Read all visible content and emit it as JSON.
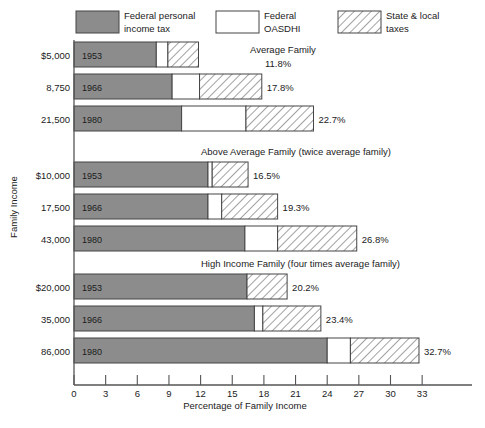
{
  "legend": {
    "items": [
      {
        "key": "gray",
        "label_line1": "Federal personal",
        "label_line2": "income tax",
        "color": "#8c8c8c",
        "pattern": "solid"
      },
      {
        "key": "white",
        "label_line1": "Federal",
        "label_line2": "OASDHI",
        "color": "#ffffff",
        "pattern": "solid"
      },
      {
        "key": "hatch",
        "label_line1": "State & local",
        "label_line2": "taxes",
        "color": "#ffffff",
        "pattern": "diagonal-hatch"
      }
    ]
  },
  "axes": {
    "xlabel": "Percentage of Family Income",
    "ylabel": "Family Income",
    "xticks": [
      "0",
      "3",
      "6",
      "9",
      "12",
      "15",
      "18",
      "21",
      "24",
      "27",
      "30",
      "33"
    ],
    "xmin": 0,
    "xmax": 36
  },
  "chart_data": {
    "type": "bar",
    "orientation": "horizontal",
    "stacked": true,
    "title": "",
    "xlabel": "Percentage of Family Income",
    "ylabel": "Family Income",
    "xlim": [
      0,
      36
    ],
    "grid": false,
    "legend_position": "top",
    "series": [
      {
        "name": "Federal personal income tax",
        "key": "gray",
        "color": "#8c8c8c",
        "pattern": "solid"
      },
      {
        "name": "Federal OASDHI",
        "key": "white",
        "color": "#ffffff",
        "pattern": "solid"
      },
      {
        "name": "State & local taxes",
        "key": "hatch",
        "color": "#ffffff",
        "pattern": "diagonal-hatch"
      }
    ],
    "groups": [
      {
        "name": "Average Family",
        "caption": "Average Family",
        "bars": [
          {
            "income": "$5,000",
            "year": "1953",
            "federal_income_tax": 7.8,
            "oasdhi": 1.1,
            "state_local": 2.9,
            "total": 11.8,
            "total_label": "11.8%"
          },
          {
            "income": "8,750",
            "year": "1966",
            "federal_income_tax": 9.3,
            "oasdhi": 2.6,
            "state_local": 5.9,
            "total": 17.8,
            "total_label": "17.8%"
          },
          {
            "income": "21,500",
            "year": "1980",
            "federal_income_tax": 10.2,
            "oasdhi": 6.1,
            "state_local": 6.4,
            "total": 22.7,
            "total_label": "22.7%"
          }
        ]
      },
      {
        "name": "Above Average Family",
        "caption": "Above Average Family (twice average family)",
        "bars": [
          {
            "income": "$10,000",
            "year": "1953",
            "federal_income_tax": 12.7,
            "oasdhi": 0.4,
            "state_local": 3.4,
            "total": 16.5,
            "total_label": "16.5%"
          },
          {
            "income": "17,500",
            "year": "1966",
            "federal_income_tax": 12.7,
            "oasdhi": 1.3,
            "state_local": 5.3,
            "total": 19.3,
            "total_label": "19.3%"
          },
          {
            "income": "43,000",
            "year": "1980",
            "federal_income_tax": 16.2,
            "oasdhi": 3.1,
            "state_local": 7.5,
            "total": 26.8,
            "total_label": "26.8%"
          }
        ]
      },
      {
        "name": "High Income Family",
        "caption": "High Income Family (four times average family)",
        "bars": [
          {
            "income": "$20,000",
            "year": "1953",
            "federal_income_tax": 16.4,
            "oasdhi": 0.0,
            "state_local": 3.8,
            "total": 20.2,
            "total_label": "20.2%"
          },
          {
            "income": "35,000",
            "year": "1966",
            "federal_income_tax": 17.1,
            "oasdhi": 0.8,
            "state_local": 5.5,
            "total": 23.4,
            "total_label": "23.4%"
          },
          {
            "income": "86,000",
            "year": "1980",
            "federal_income_tax": 24.0,
            "oasdhi": 2.2,
            "state_local": 6.5,
            "total": 32.7,
            "total_label": "32.7%"
          }
        ]
      }
    ]
  },
  "colors": {
    "gray_fill": "#8c8c8c",
    "stroke": "#444444",
    "axis": "#555555",
    "text": "#1b1b1b"
  }
}
